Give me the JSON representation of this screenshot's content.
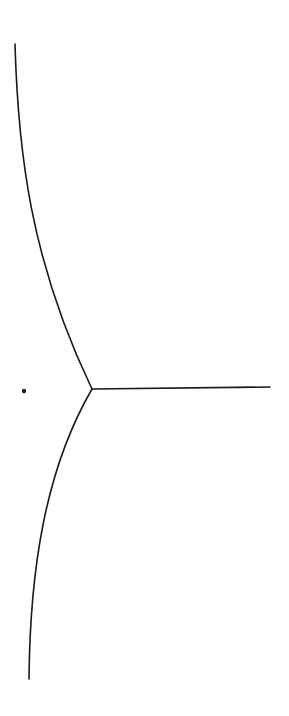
{
  "diagram": {
    "type": "line-drawing",
    "background": "#ffffff",
    "stroke_color": "#1a1a1a",
    "stroke_width": 1.6,
    "junction": {
      "x": 92,
      "y": 389
    },
    "point": {
      "x": 24,
      "y": 391,
      "r": 2.2
    },
    "branches": [
      {
        "name": "upper-curve",
        "path": "M 15 44 C 18 150, 30 260, 92 389"
      },
      {
        "name": "horizontal-ray",
        "path": "M 92 389 L 270 387"
      },
      {
        "name": "lower-curve",
        "path": "M 92 389 C 45 470, 30 570, 29 679"
      }
    ]
  }
}
